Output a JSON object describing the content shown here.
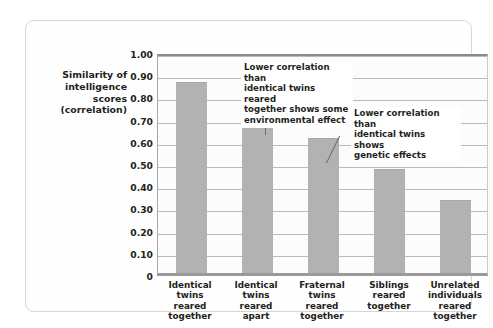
{
  "chart_data": {
    "type": "bar",
    "title": "",
    "xlabel": "",
    "ylabel": "Similarity of intelligence scores (correlation)",
    "ylabel_lines": [
      "Similarity of",
      "intelligence",
      "scores",
      "(correlation)"
    ],
    "ylim": [
      0,
      1.0
    ],
    "grid": true,
    "legend": "none",
    "y_ticks": [
      "1.00",
      "0.90",
      "0.80",
      "0.70",
      "0.60",
      "0.50",
      "0.40",
      "0.30",
      "0.20",
      "0.10",
      "0"
    ],
    "y_tick_values": [
      1.0,
      0.9,
      0.8,
      0.7,
      0.6,
      0.5,
      0.4,
      0.3,
      0.2,
      0.1,
      0.0
    ],
    "categories": [
      "Identical twins reared together",
      "Identical twins reared apart",
      "Fraternal twins reared together",
      "Siblings reared together",
      "Unrelated individuals reared together"
    ],
    "category_lines": [
      [
        "Identical",
        "twins",
        "reared",
        "together"
      ],
      [
        "Identical",
        "twins",
        "reared",
        "apart"
      ],
      [
        "Fraternal",
        "twins",
        "reared",
        "together"
      ],
      [
        "Siblings",
        "reared",
        "together"
      ],
      [
        "Unrelated",
        "individuals",
        "reared",
        "together"
      ]
    ],
    "values": [
      0.86,
      0.72,
      0.61,
      0.47,
      0.33
    ],
    "bar_color": "#b2b2b2",
    "annotations": [
      {
        "id": "environmental",
        "lines": [
          "Lower correlation than",
          "identical twins reared",
          "together shows some",
          "environmental effect"
        ],
        "text": "Lower correlation than identical twins reared together shows some environmental effect",
        "points_to": "Identical twins reared apart"
      },
      {
        "id": "genetic",
        "lines": [
          "Lower correlation than",
          "identical twins shows",
          "genetic effects"
        ],
        "text": "Lower correlation than identical twins shows genetic effects",
        "points_to": "Fraternal twins reared together"
      }
    ]
  }
}
